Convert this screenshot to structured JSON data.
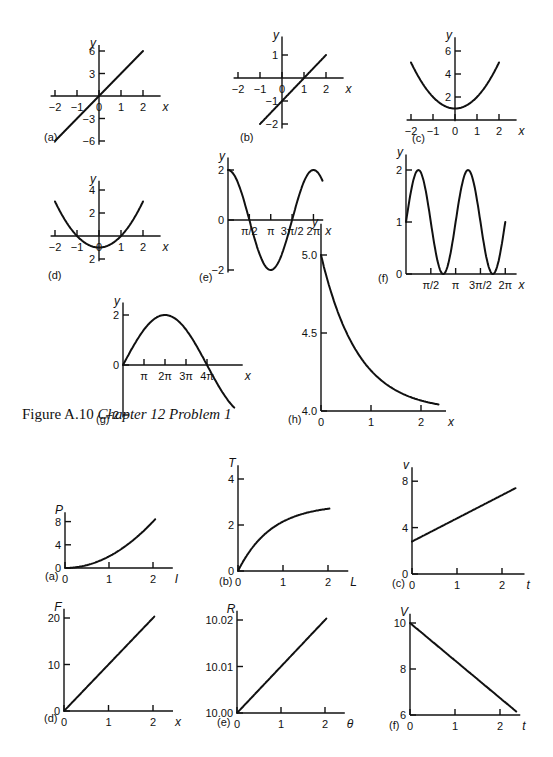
{
  "caption": {
    "prefix": "Figure A.10 ",
    "italic": "Chapter 12 Problem 1"
  },
  "chart_data": [
    {
      "id": "top-a",
      "panel": "(a)",
      "type": "line",
      "xlabel": "x",
      "ylabel": "y",
      "function": "y = 3x",
      "xticks": [
        "−2",
        "−1",
        "0",
        "1",
        "2"
      ],
      "yticks": [
        "6",
        "3",
        "−3",
        "−6"
      ],
      "xlim": [
        -2,
        2
      ],
      "ylim": [
        -6,
        6
      ],
      "x": [
        -2,
        -1,
        0,
        1,
        2
      ],
      "y": [
        -6,
        -3,
        0,
        3,
        6
      ]
    },
    {
      "id": "top-b",
      "panel": "(b)",
      "type": "line",
      "xlabel": "x",
      "ylabel": "y",
      "function": "y = x − 1",
      "xticks": [
        "−2",
        "−1",
        "0",
        "1",
        "2"
      ],
      "yticks": [
        "1",
        "−1",
        "−2"
      ],
      "xlim": [
        -2,
        2
      ],
      "ylim": [
        -2,
        1
      ],
      "x": [
        -1,
        0,
        1,
        2
      ],
      "y": [
        -2,
        -1,
        0,
        1
      ]
    },
    {
      "id": "top-c",
      "panel": "(c)",
      "type": "line",
      "xlabel": "x",
      "ylabel": "y",
      "function": "y = x² + 1",
      "xticks": [
        "−2",
        "−1",
        "0",
        "1",
        "2"
      ],
      "yticks": [
        "2",
        "4",
        "6"
      ],
      "xlim": [
        -2,
        2
      ],
      "ylim": [
        0,
        6
      ],
      "x": [
        -2,
        -1,
        0,
        1,
        2
      ],
      "y": [
        5,
        2,
        1,
        2,
        5
      ]
    },
    {
      "id": "top-d",
      "panel": "(d)",
      "type": "line",
      "xlabel": "x",
      "ylabel": "y",
      "function": "y = x² − 1",
      "xticks": [
        "−2",
        "−1",
        "0",
        "1",
        "2"
      ],
      "yticks": [
        "4",
        "2",
        "2"
      ],
      "xlim": [
        -2,
        2
      ],
      "ylim": [
        -2,
        4
      ],
      "x": [
        -2,
        -1,
        0,
        1,
        2
      ],
      "y": [
        3,
        0,
        -1,
        0,
        3
      ]
    },
    {
      "id": "top-e",
      "panel": "(e)",
      "type": "line",
      "xlabel": "x",
      "ylabel": "y",
      "function": "y = 2cos(x)",
      "xticks": [
        "π/2",
        "π",
        "3π/2",
        "2π"
      ],
      "yticks": [
        "2",
        "0",
        "−2"
      ],
      "xlim": [
        0,
        6.6
      ],
      "ylim": [
        -2,
        2
      ],
      "x": [
        0,
        1.571,
        3.142,
        4.712,
        6.283
      ],
      "y": [
        2,
        0,
        -2,
        0,
        2
      ]
    },
    {
      "id": "top-f",
      "panel": "(f)",
      "type": "line",
      "xlabel": "x",
      "ylabel": "y",
      "function": "y = 1 + sin(2x)",
      "xticks": [
        "π/2",
        "π",
        "3π/2",
        "2π"
      ],
      "yticks": [
        "2",
        "1",
        "0"
      ],
      "xlim": [
        0,
        6.283
      ],
      "ylim": [
        0,
        2
      ],
      "x": [
        0,
        0.785,
        2.356,
        3.927,
        5.498,
        6.283
      ],
      "y": [
        1,
        2,
        0,
        2,
        0,
        1
      ]
    },
    {
      "id": "top-g",
      "panel": "(g)",
      "type": "line",
      "xlabel": "x",
      "ylabel": "y",
      "function": "y = 2sin(x/2)",
      "xticks": [
        "π",
        "2π",
        "3π",
        "4π"
      ],
      "yticks": [
        "2",
        "0",
        "−2"
      ],
      "xlim": [
        0,
        5.4
      ],
      "ylim": [
        -2,
        2
      ],
      "x": [
        0,
        3.14,
        6.28,
        9.42,
        12.57
      ],
      "y": [
        0,
        2,
        0,
        -2,
        0
      ]
    },
    {
      "id": "top-h",
      "panel": "(h)",
      "type": "line",
      "xlabel": "x",
      "ylabel": "y",
      "function": "y = 4 + e^(−x)",
      "xticks": [
        "0",
        "1",
        "2"
      ],
      "yticks": [
        "5.0",
        "4.5",
        "4.0"
      ],
      "xlim": [
        0,
        2.35
      ],
      "ylim": [
        4,
        5
      ],
      "x": [
        0,
        0.5,
        1,
        1.5,
        2,
        2.35
      ],
      "y": [
        5,
        4.61,
        4.37,
        4.22,
        4.14,
        4.1
      ]
    },
    {
      "id": "bot-a",
      "panel": "(a)",
      "type": "line",
      "xlabel": "I",
      "ylabel": "P",
      "function": "P ∝ I²",
      "xticks": [
        "0",
        "1",
        "2"
      ],
      "yticks": [
        "0",
        "4",
        "8"
      ],
      "xlim": [
        0,
        2.3
      ],
      "ylim": [
        0,
        9
      ],
      "x": [
        0,
        0.5,
        1,
        1.5,
        2
      ],
      "y": [
        0,
        0.5,
        2,
        4.5,
        8
      ]
    },
    {
      "id": "bot-b",
      "panel": "(b)",
      "type": "line",
      "xlabel": "L",
      "ylabel": "T",
      "function": "T ∝ √L",
      "xticks": [
        "0",
        "1",
        "2"
      ],
      "yticks": [
        "0",
        "2",
        "4"
      ],
      "xlim": [
        0,
        2.3
      ],
      "ylim": [
        0,
        4.5
      ],
      "x": [
        0,
        0.5,
        1,
        1.5,
        2
      ],
      "y": [
        0,
        1.1,
        2,
        2.5,
        2.8
      ]
    },
    {
      "id": "bot-c",
      "panel": "(c)",
      "type": "line",
      "xlabel": "t",
      "ylabel": "v",
      "function": "v = 2.8 + 2t",
      "xticks": [
        "0",
        "1",
        "2"
      ],
      "yticks": [
        "0",
        "4",
        "8"
      ],
      "xlim": [
        0,
        2.4
      ],
      "ylim": [
        0,
        9
      ],
      "x": [
        0,
        1,
        2,
        2.3
      ],
      "y": [
        2.8,
        4.8,
        6.8,
        7.3
      ]
    },
    {
      "id": "bot-d",
      "panel": "(d)",
      "type": "line",
      "xlabel": "x",
      "ylabel": "F",
      "function": "F = 10x",
      "xticks": [
        "0",
        "1",
        "2"
      ],
      "yticks": [
        "0",
        "10",
        "20"
      ],
      "xlim": [
        0,
        2.3
      ],
      "ylim": [
        0,
        22
      ],
      "x": [
        0,
        1,
        2
      ],
      "y": [
        0,
        10,
        20
      ]
    },
    {
      "id": "bot-e",
      "panel": "(e)",
      "type": "line",
      "xlabel": "θ",
      "ylabel": "R",
      "function": "R = 10 + 0.01θ",
      "xticks": [
        "0",
        "1",
        "2"
      ],
      "yticks": [
        "10.00",
        "10.01",
        "10.02"
      ],
      "xlim": [
        0,
        2.3
      ],
      "ylim": [
        10,
        10.022
      ],
      "x": [
        0,
        1,
        2
      ],
      "y": [
        10,
        10.01,
        10.02
      ]
    },
    {
      "id": "bot-f",
      "panel": "(f)",
      "type": "line",
      "xlabel": "t",
      "ylabel": "V",
      "function": "V = 10 − 1.6t",
      "xticks": [
        "0",
        "1",
        "2"
      ],
      "yticks": [
        "6",
        "8",
        "10"
      ],
      "xlim": [
        0,
        2.4
      ],
      "ylim": [
        6,
        10.5
      ],
      "x": [
        0,
        1,
        2,
        2.35
      ],
      "y": [
        10,
        8.4,
        6.8,
        6.2
      ]
    }
  ]
}
